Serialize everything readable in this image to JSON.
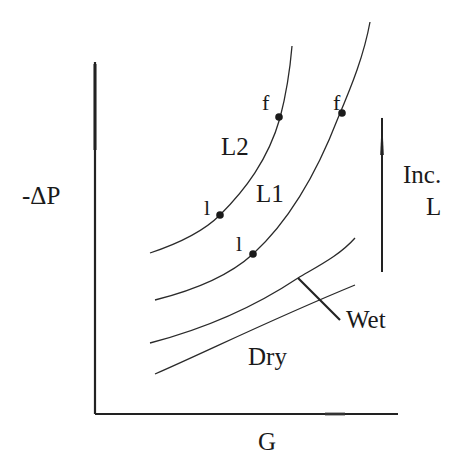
{
  "diagram": {
    "type": "pressure-drop vs gas flow schematic",
    "axes": {
      "y_label": "-ΔP",
      "x_label": "G"
    },
    "curves": [
      {
        "id": "L2",
        "label": "L2",
        "description": "loaded curve, higher liquid rate"
      },
      {
        "id": "L1",
        "label": "L1",
        "description": "loaded curve, lower liquid rate"
      },
      {
        "id": "wet",
        "label": "Wet"
      },
      {
        "id": "dry",
        "label": "Dry"
      }
    ],
    "points": [
      {
        "label": "l",
        "curve": "L2",
        "meaning": "loading point"
      },
      {
        "label": "f",
        "curve": "L2",
        "meaning": "flooding point"
      },
      {
        "label": "l",
        "curve": "L1",
        "meaning": "loading point"
      },
      {
        "label": "f",
        "curve": "L1",
        "meaning": "flooding point"
      }
    ],
    "arrow": {
      "label_line1": "Inc.",
      "label_line2": "L",
      "direction": "up"
    },
    "colors": {
      "ink": "#222222",
      "background": "#ffffff"
    }
  }
}
